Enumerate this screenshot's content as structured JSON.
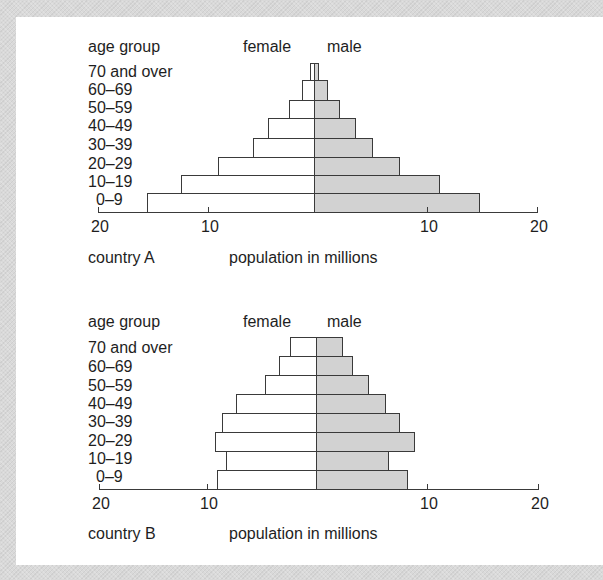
{
  "chart_data": [
    {
      "type": "bar",
      "subtype": "population-pyramid",
      "title": "country A",
      "xlabel": "population in millions",
      "ylabel": "age group",
      "categories": [
        "70 and over",
        "60–69",
        "50–59",
        "40–49",
        "30–39",
        "20–29",
        "10–19",
        "0–9"
      ],
      "series": [
        {
          "name": "female",
          "values": [
            0.4,
            1.1,
            2.3,
            4.2,
            5.5,
            8.7,
            12.1,
            15.2
          ],
          "color": "#ffffff"
        },
        {
          "name": "male",
          "values": [
            0.4,
            1.2,
            2.3,
            3.7,
            5.3,
            7.7,
            11.4,
            15.0
          ],
          "color": "#d2d2d2"
        }
      ],
      "xticks": [
        "20",
        "10",
        "10",
        "20"
      ],
      "xlim": [
        -20,
        20
      ],
      "grid": false
    },
    {
      "type": "bar",
      "subtype": "population-pyramid",
      "title": "country B",
      "xlabel": "population in millions",
      "ylabel": "age group",
      "categories": [
        "70 and over",
        "60–69",
        "50–59",
        "40–49",
        "30–39",
        "20–29",
        "10–19",
        "0–9"
      ],
      "series": [
        {
          "name": "female",
          "values": [
            2.4,
            3.4,
            4.6,
            7.3,
            8.5,
            9.2,
            8.2,
            9.0
          ],
          "color": "#ffffff"
        },
        {
          "name": "male",
          "values": [
            2.4,
            3.3,
            4.7,
            6.3,
            7.5,
            8.9,
            6.5,
            8.3
          ],
          "color": "#d2d2d2"
        }
      ],
      "xticks": [
        "20",
        "10",
        "10",
        "20"
      ],
      "xlim": [
        -20,
        20
      ],
      "grid": false
    }
  ],
  "charts": [
    {
      "header": {
        "age_group": "age group",
        "female": "female",
        "male": "male"
      },
      "ages": [
        "70 and over",
        "60–69",
        "50–59",
        "40–49",
        "30–39",
        "20–29",
        "10–19",
        "0–9"
      ],
      "ticks": [
        "20",
        "10",
        "10",
        "20"
      ],
      "country": "country A",
      "xlabel": "population in millions"
    },
    {
      "header": {
        "age_group": "age group",
        "female": "female",
        "male": "male"
      },
      "ages": [
        "70 and over",
        "60–69",
        "50–59",
        "40–49",
        "30–39",
        "20–29",
        "10–19",
        "0–9"
      ],
      "ticks": [
        "20",
        "10",
        "10",
        "20"
      ],
      "country": "country B",
      "xlabel": "population in millions"
    }
  ]
}
